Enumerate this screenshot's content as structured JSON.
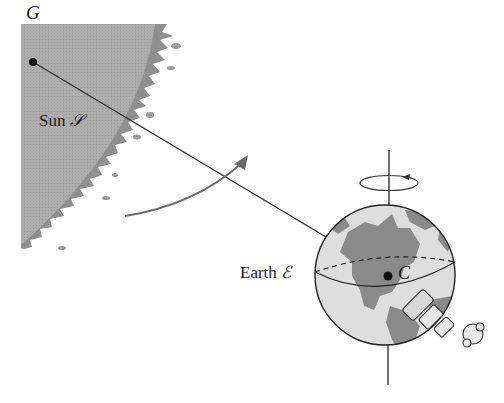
{
  "diagram": {
    "type": "physics-illustration",
    "colors": {
      "sun_fill": "#a9a9a9",
      "sun_corona": "#8e8e8e",
      "earth_land": "#8a8a8a",
      "earth_ocean": "#dcdcdc",
      "line": "#2a2a2a"
    },
    "labels": {
      "point_g": "G",
      "sun_name": "Sun",
      "sun_symbol": "𝒮",
      "earth_name": "Earth",
      "earth_symbol": "ℰ",
      "point_c": "C"
    },
    "elements": [
      "sun-body",
      "line-g-to-c",
      "orbit-arrow",
      "earth-globe",
      "rotation-axis",
      "rotation-arrow",
      "equator",
      "astronaut"
    ]
  }
}
